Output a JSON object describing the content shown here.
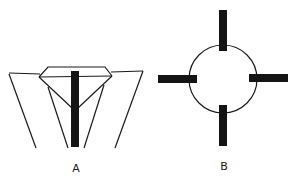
{
  "figures": [
    {
      "id": "A",
      "label": "A",
      "description": "diamond setting with prongs and central bar"
    },
    {
      "id": "B",
      "label": "B",
      "description": "circle with four radial bars"
    }
  ],
  "colors": {
    "ink": "#1a1a1a",
    "background": "#ffffff"
  }
}
